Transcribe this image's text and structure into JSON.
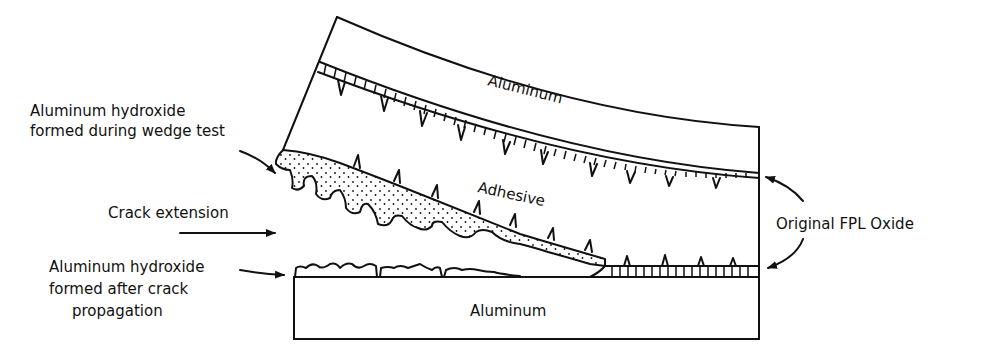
{
  "diagram": {
    "type": "schematic cross-section",
    "layers": {
      "top_plate": "Aluminum",
      "middle": "Adhesive",
      "bottom_plate": "Aluminum"
    },
    "annotations": {
      "hydroxide_wedge_line1": "Aluminum hydroxide",
      "hydroxide_wedge_line2": "formed during wedge test",
      "crack_extension": "Crack extension",
      "hydroxide_after_line1": "Aluminum hydroxide",
      "hydroxide_after_line2": "formed after crack",
      "hydroxide_after_line3": "propagation",
      "original_oxide": "Original FPL Oxide"
    },
    "colors": {
      "line": "#111111",
      "background": "#ffffff"
    }
  }
}
